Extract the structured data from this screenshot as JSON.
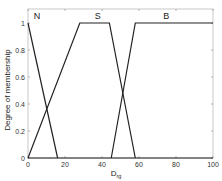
{
  "chart_data": {
    "type": "line",
    "title": "",
    "xlabel": "D",
    "xlabel_sub": "rg",
    "ylabel": "Degree of membership",
    "xlim": [
      0,
      100
    ],
    "ylim": [
      0,
      1
    ],
    "x_ticks": [
      "0",
      "20",
      "40",
      "60",
      "80",
      "100"
    ],
    "y_ticks": [
      "0",
      "0.2",
      "0.4",
      "0.6",
      "0.8",
      "1"
    ],
    "grid": false,
    "legend": "none",
    "series": [
      {
        "name": "N",
        "x": [
          0,
          16
        ],
        "y": [
          1,
          0
        ]
      },
      {
        "name": "S",
        "x": [
          0,
          28,
          44,
          58
        ],
        "y": [
          0,
          1,
          1,
          0
        ]
      },
      {
        "name": "B",
        "x": [
          45,
          58,
          100
        ],
        "y": [
          0,
          1,
          1
        ]
      }
    ]
  }
}
